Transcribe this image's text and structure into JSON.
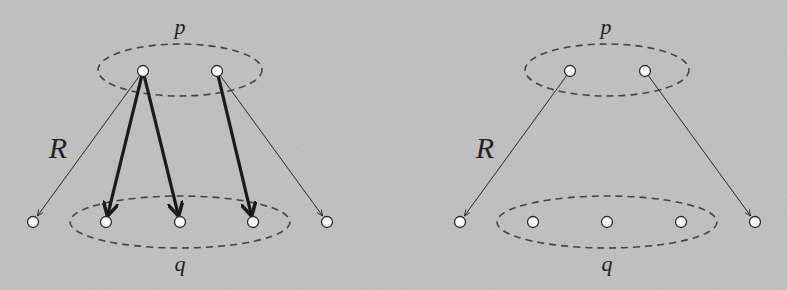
{
  "colors": {
    "background": "#b8b8b8",
    "stroke": "#2a2a2a",
    "node_fill": "#ffffff",
    "ellipse": "#444444"
  },
  "panels": [
    {
      "id": "left",
      "labels": {
        "top_set": "p",
        "bottom_set": "q",
        "relation": "R"
      },
      "top_ellipse": {
        "cx": 180,
        "cy": 70,
        "rx": 82,
        "ry": 26
      },
      "bottom_ellipse": {
        "cx": 180,
        "cy": 222,
        "rx": 110,
        "ry": 26
      },
      "top_nodes": [
        {
          "x": 143,
          "y": 71
        },
        {
          "x": 217,
          "y": 71
        }
      ],
      "bottom_nodes": [
        {
          "x": 33,
          "y": 222
        },
        {
          "x": 106,
          "y": 222
        },
        {
          "x": 180,
          "y": 222
        },
        {
          "x": 253,
          "y": 222
        },
        {
          "x": 327,
          "y": 222
        }
      ],
      "edges": [
        {
          "from": 0,
          "to": 0,
          "bold": false
        },
        {
          "from": 0,
          "to": 1,
          "bold": true
        },
        {
          "from": 0,
          "to": 2,
          "bold": true
        },
        {
          "from": 1,
          "to": 3,
          "bold": true
        },
        {
          "from": 1,
          "to": 4,
          "bold": false
        }
      ],
      "label_pos": {
        "top_set": [
          180,
          27
        ],
        "bottom_set": [
          180,
          264
        ],
        "relation": [
          58,
          148
        ]
      }
    },
    {
      "id": "right",
      "labels": {
        "top_set": "p",
        "bottom_set": "q",
        "relation": "R"
      },
      "top_ellipse": {
        "cx": 607,
        "cy": 70,
        "rx": 82,
        "ry": 26
      },
      "bottom_ellipse": {
        "cx": 607,
        "cy": 222,
        "rx": 110,
        "ry": 26
      },
      "top_nodes": [
        {
          "x": 570,
          "y": 71
        },
        {
          "x": 645,
          "y": 71
        }
      ],
      "bottom_nodes": [
        {
          "x": 460,
          "y": 222
        },
        {
          "x": 533,
          "y": 222
        },
        {
          "x": 607,
          "y": 222
        },
        {
          "x": 681,
          "y": 222
        },
        {
          "x": 755,
          "y": 222
        }
      ],
      "edges": [
        {
          "from": 0,
          "to": 0,
          "bold": false
        },
        {
          "from": 1,
          "to": 4,
          "bold": false
        }
      ],
      "label_pos": {
        "top_set": [
          606,
          27
        ],
        "bottom_set": [
          607,
          264
        ],
        "relation": [
          485,
          148
        ]
      }
    }
  ]
}
